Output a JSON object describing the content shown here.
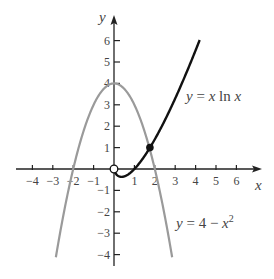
{
  "chart_data": {
    "type": "line",
    "title": "",
    "xlabel": "x",
    "ylabel": "y",
    "xlim": [
      -4.4,
      7.0
    ],
    "ylim": [
      -4.6,
      7.2
    ],
    "grid": false,
    "x_ticks": [
      -4,
      -3,
      -2,
      -1,
      1,
      2,
      3,
      4,
      5,
      6
    ],
    "y_ticks": [
      -4,
      -3,
      -2,
      -1,
      1,
      2,
      3,
      4,
      5,
      6
    ],
    "series": [
      {
        "name": "y = x ln x",
        "label_parts": [
          "y",
          " = ",
          "x",
          " ln ",
          "x"
        ],
        "color": "#111111",
        "domain": [
          0,
          4.2
        ],
        "function": "x*ln(x)",
        "points": [
          [
            0,
            0
          ],
          [
            0.1,
            -0.23
          ],
          [
            0.368,
            -0.368
          ],
          [
            0.7,
            -0.25
          ],
          [
            1,
            0
          ],
          [
            1.5,
            0.61
          ],
          [
            1.76,
            1.0
          ],
          [
            2,
            1.39
          ],
          [
            2.5,
            2.29
          ],
          [
            3,
            3.3
          ],
          [
            3.5,
            4.38
          ],
          [
            4,
            5.55
          ],
          [
            4.2,
            6.03
          ]
        ]
      },
      {
        "name": "y = 4 − x²",
        "label_parts": [
          "y",
          " = 4 − ",
          "x",
          "2"
        ],
        "color": "#9a9a9a",
        "domain": [
          -2.85,
          2.85
        ],
        "function": "4 - x^2",
        "points": [
          [
            -2.85,
            -4.12
          ],
          [
            -2,
            0
          ],
          [
            -1,
            3
          ],
          [
            0,
            4
          ],
          [
            1,
            3
          ],
          [
            2,
            0
          ],
          [
            2.85,
            -4.12
          ]
        ]
      }
    ],
    "annotations": [
      {
        "type": "open-circle",
        "x": 0,
        "y": 0,
        "note": "x ln x undefined at 0"
      },
      {
        "type": "filled-circle",
        "x": 1.76,
        "y": 1.0,
        "note": "intersection of curves"
      }
    ]
  },
  "axes": {
    "x_label": "x",
    "y_label": "y",
    "x_tick_labels": [
      "−4",
      "−3",
      "−2",
      "−1",
      "1",
      "2",
      "3",
      "4",
      "5",
      "6"
    ],
    "y_tick_labels": [
      "6",
      "5",
      "4",
      "3",
      "2",
      "1",
      "−1",
      "−2",
      "−3",
      "−4"
    ]
  },
  "labels": {
    "curve1_y": "y",
    "curve1_eq": " = ",
    "curve1_x1": "x",
    "curve1_ln": " ln ",
    "curve1_x2": "x",
    "curve2_y": "y",
    "curve2_eq": " = 4 − ",
    "curve2_x": "x",
    "curve2_exp": "2"
  },
  "colors": {
    "curve1": "#111111",
    "curve2": "#9a9a9a",
    "axes": "#222222",
    "text": "#444444"
  }
}
